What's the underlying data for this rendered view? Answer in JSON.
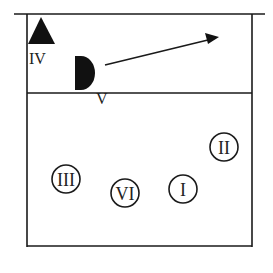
{
  "diagram": {
    "line_color": "#1a1a1a",
    "background": "#ffffff",
    "front_zone": {
      "players": [
        {
          "label": "IV",
          "shape": "triangle",
          "role": "blocker"
        },
        {
          "label": "V",
          "shape": "half-circle",
          "role": "player"
        }
      ],
      "arrow": {
        "description": "movement direction"
      }
    },
    "back_zone": {
      "players": [
        {
          "label": "III"
        },
        {
          "label": "VI"
        },
        {
          "label": "I"
        },
        {
          "label": "II"
        }
      ]
    }
  }
}
